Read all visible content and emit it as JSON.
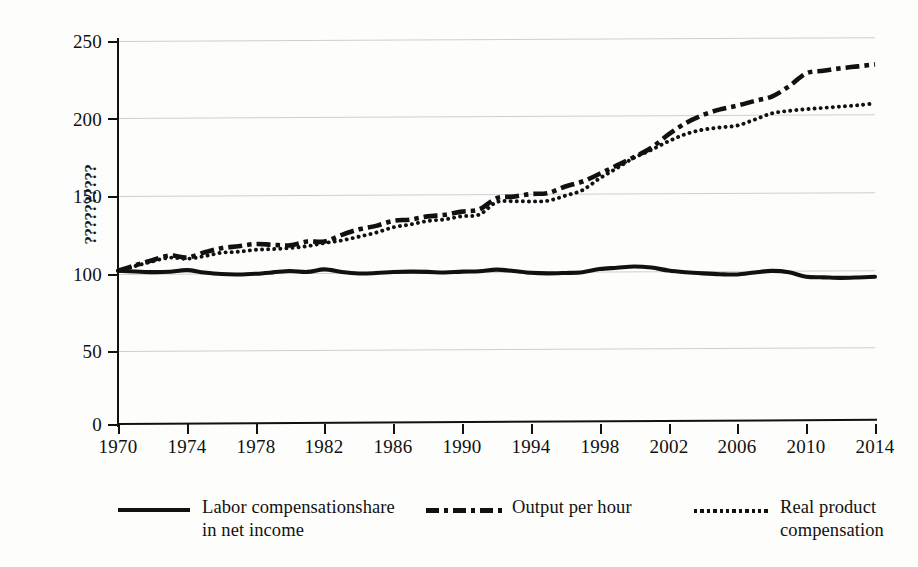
{
  "chart_data": {
    "type": "line",
    "title": "",
    "subtitle": "",
    "xlabel": "",
    "ylabel": "??????????",
    "xlim": [
      1970,
      2014
    ],
    "ylim": [
      0,
      250
    ],
    "xticks": [
      1970,
      1974,
      1978,
      1982,
      1986,
      1990,
      1994,
      1998,
      2002,
      2006,
      2010,
      2014
    ],
    "yticks": [
      0,
      50,
      100,
      150,
      200,
      250
    ],
    "grid": "horizontal",
    "legend_position": "bottom",
    "x": [
      1970,
      1971,
      1972,
      1973,
      1974,
      1975,
      1976,
      1977,
      1978,
      1979,
      1980,
      1981,
      1982,
      1983,
      1984,
      1985,
      1986,
      1987,
      1988,
      1989,
      1990,
      1991,
      1992,
      1993,
      1994,
      1995,
      1996,
      1997,
      1998,
      1999,
      2000,
      2001,
      2002,
      2003,
      2004,
      2005,
      2006,
      2007,
      2008,
      2009,
      2010,
      2011,
      2012,
      2013,
      2014
    ],
    "series": [
      {
        "name": "Labor compensationshare in net income",
        "style": "solid",
        "color": "#111111",
        "values": [
          100,
          99.5,
          99.0,
          99.2,
          100.2,
          98.6,
          97.5,
          97.2,
          97.6,
          98.4,
          99.3,
          98.6,
          100.2,
          98.4,
          97.4,
          97.6,
          98.2,
          98.4,
          98.2,
          97.7,
          98.2,
          98.4,
          99.4,
          98.4,
          97.2,
          96.8,
          97.0,
          97.4,
          99.4,
          100.2,
          101.0,
          100.2,
          98.2,
          97.0,
          96.2,
          95.6,
          95.4,
          96.6,
          97.6,
          96.6,
          93.6,
          93.2,
          92.8,
          93.0,
          93.4
        ]
      },
      {
        "name": "Output per hour",
        "style": "dashdot",
        "color": "#111111",
        "values": [
          100,
          103.5,
          106.8,
          109.8,
          108.4,
          111.6,
          114.4,
          115.6,
          117.0,
          116.4,
          116.0,
          118.4,
          118.4,
          122.6,
          126.2,
          128.4,
          131.6,
          132.4,
          134.4,
          135.4,
          137.4,
          138.8,
          146.0,
          147.0,
          148.6,
          149.2,
          153.4,
          156.6,
          161.6,
          167.0,
          172.4,
          178.4,
          187.0,
          194.4,
          199.6,
          203.2,
          205.6,
          208.6,
          211.4,
          218.0,
          226.4,
          228.0,
          229.6,
          230.8,
          232.0
        ]
      },
      {
        "name": "Real product compensation",
        "style": "dotted",
        "color": "#111111",
        "values": [
          100,
          103.0,
          106.0,
          108.4,
          107.6,
          109.2,
          111.4,
          112.0,
          113.2,
          113.6,
          114.2,
          115.4,
          117.4,
          119.0,
          121.4,
          124.0,
          127.4,
          129.2,
          131.4,
          132.4,
          134.4,
          135.4,
          143.4,
          144.0,
          143.8,
          144.2,
          147.4,
          151.0,
          158.6,
          165.2,
          172.0,
          177.0,
          182.6,
          187.2,
          190.0,
          191.4,
          192.6,
          196.4,
          200.4,
          202.0,
          203.0,
          203.8,
          204.6,
          205.4,
          206.6
        ]
      }
    ]
  },
  "axes": {
    "y_title": "??????????",
    "y_tick_labels": [
      "250",
      "200",
      "150",
      "100",
      "50",
      "0"
    ],
    "x_tick_labels": [
      "1970",
      "1974",
      "1978",
      "1982",
      "1986",
      "1990",
      "1994",
      "1998",
      "2002",
      "2006",
      "2010",
      "2014"
    ]
  },
  "legend": {
    "items": [
      {
        "label": "Labor compensationshare\nin net income",
        "style": "solid"
      },
      {
        "label": "Output per hour",
        "style": "dashdot"
      },
      {
        "label": "Real product\ncompensation",
        "style": "dotted"
      }
    ]
  },
  "colors": {
    "ink": "#111111",
    "grid": "#cfcfcf",
    "background": "#fdfdfb"
  }
}
